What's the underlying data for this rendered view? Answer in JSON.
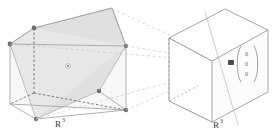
{
  "figure": {
    "title_visible": false,
    "background_color": "#ffffff",
    "left_panel": {
      "name": "source-cube",
      "axis_label": "R",
      "axis_label_exponent": "3",
      "cube": {
        "edge_color": "#9a9a9a",
        "hidden_edge_color": "#555555",
        "face_fill": "#f2f2f2",
        "face_fill_alt": "#eaeaea"
      },
      "cross_section": {
        "name": "hexagonal-cross-section",
        "fill_color": "#d8d8d8",
        "fill_color_light": "#e8e8e8",
        "vertex_color": "#6e6e6e",
        "vertex_count": 6
      },
      "center_point": {
        "name": "center-dot",
        "color": "#8c8c8c"
      }
    },
    "right_panel": {
      "name": "target-cube",
      "axis_label": "R",
      "axis_label_exponent": "3",
      "cube": {
        "edge_color": "#8f8f8f",
        "hidden_edge_color": "#9a9a9a",
        "face_fill": "#ffffff"
      },
      "origin_point": {
        "name": "origin-dot",
        "color": "#4a4a4a"
      },
      "vector_label": {
        "name": "zero-vector",
        "open_paren": "(",
        "close_paren": ")",
        "entries": [
          "0",
          "0",
          "0"
        ],
        "color": "#6a6a6a"
      },
      "diagonal_line_color": "#cccccc"
    },
    "connectors": {
      "name": "projection-dashed-lines",
      "color": "#c2c2c2",
      "count": 4,
      "style": "dashed"
    }
  }
}
